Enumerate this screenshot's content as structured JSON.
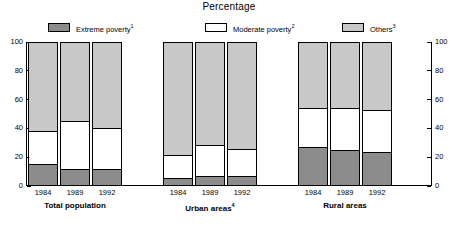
{
  "chart_data": {
    "type": "bar",
    "subtype": "stacked-100-percent",
    "title": "Percentage",
    "xlabel": "",
    "ylabel": "",
    "ylim": [
      0,
      100
    ],
    "yticks": [
      0,
      20,
      40,
      60,
      80,
      100
    ],
    "ytick_labels_left": [
      "0",
      "20",
      "40",
      "60",
      "80",
      "100"
    ],
    "ytick_labels_right": [
      "0",
      "20",
      "40",
      "60",
      "80",
      "100"
    ],
    "grid": false,
    "legend_position": "top",
    "legend": [
      {
        "label": "Extreme poverty",
        "note": "1",
        "color": "#8c8c8c",
        "key": "extreme"
      },
      {
        "label": "Moderate poverty",
        "note": "2",
        "color": "#ffffff",
        "key": "moderate"
      },
      {
        "label": "Others",
        "note": "3",
        "color": "#c8c8c8",
        "key": "others"
      }
    ],
    "series": [
      {
        "name": "Extreme poverty",
        "key": "extreme",
        "color": "#8c8c8c",
        "values": [
          15,
          11,
          11,
          5,
          6,
          6,
          27,
          25,
          23
        ]
      },
      {
        "name": "Moderate poverty",
        "key": "moderate",
        "color": "#ffffff",
        "values": [
          23,
          34,
          29,
          16,
          22,
          19,
          27,
          29,
          30
        ]
      },
      {
        "name": "Others",
        "key": "others",
        "color": "#c8c8c8",
        "values": [
          62,
          55,
          60,
          79,
          72,
          75,
          46,
          46,
          47
        ]
      }
    ],
    "categories": [
      "1984",
      "1989",
      "1992",
      "1984",
      "1989",
      "1992",
      "1984",
      "1989",
      "1992"
    ],
    "groups": [
      {
        "label": "Total population",
        "note": "",
        "bars": [
          {
            "year": "1984",
            "extreme": 15,
            "moderate": 23,
            "others": 62
          },
          {
            "year": "1989",
            "extreme": 11,
            "moderate": 34,
            "others": 55
          },
          {
            "year": "1992",
            "extreme": 11,
            "moderate": 29,
            "others": 60
          }
        ]
      },
      {
        "label": "Urban areas",
        "note": "4",
        "bars": [
          {
            "year": "1984",
            "extreme": 5,
            "moderate": 16,
            "others": 79
          },
          {
            "year": "1989",
            "extreme": 6,
            "moderate": 22,
            "others": 72
          },
          {
            "year": "1992",
            "extreme": 6,
            "moderate": 19,
            "others": 75
          }
        ]
      },
      {
        "label": "Rural areas",
        "note": "",
        "bars": [
          {
            "year": "1984",
            "extreme": 27,
            "moderate": 27,
            "others": 46
          },
          {
            "year": "1989",
            "extreme": 25,
            "moderate": 29,
            "others": 46
          },
          {
            "year": "1992",
            "extreme": 23,
            "moderate": 30,
            "others": 47
          }
        ]
      }
    ]
  }
}
